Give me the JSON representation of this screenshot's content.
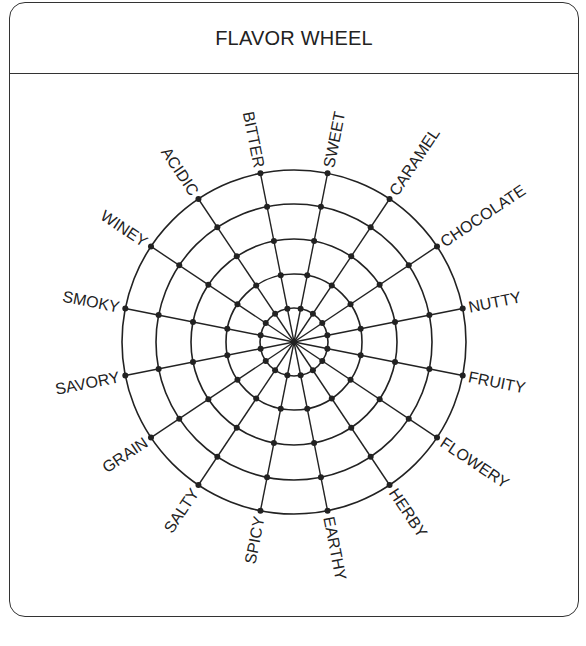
{
  "title": "FLAVOR WHEEL",
  "wheel": {
    "center": [
      294,
      342
    ],
    "ring_radii": [
      34,
      68,
      103,
      138,
      172
    ],
    "line_color": "#222222",
    "labels": [
      "SWEET",
      "CARAMEL",
      "CHOCOLATE",
      "NUTTY",
      "FRUITY",
      "FLOWERY",
      "HERBY",
      "EARTHY",
      "SPICY",
      "SALTY",
      "GRAIN",
      "SAVORY",
      "SMOKY",
      "WINEY",
      "ACIDIC",
      "BITTER"
    ]
  }
}
